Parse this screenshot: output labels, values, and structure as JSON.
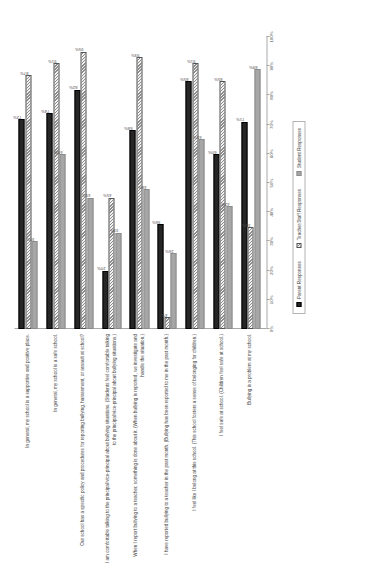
{
  "chart_data": {
    "type": "bar",
    "orientation": "vertical",
    "title": "",
    "xlabel": "",
    "ylabel": "",
    "ylim": [
      0,
      100
    ],
    "grid": false,
    "legend_position": "bottom",
    "tick_labels": [
      "0%",
      "10%",
      "20%",
      "30%",
      "40%",
      "50%",
      "60%",
      "70%",
      "80%",
      "90%",
      "100%"
    ],
    "tick_values": [
      0,
      10,
      20,
      30,
      40,
      50,
      60,
      70,
      80,
      90,
      100
    ],
    "categories": [
      "In general, my school is a supportive and positive place.",
      "In general, my school is a safe school.",
      "Our school has a specific policy and procedures for reporting bullying, harassment, or assault at school?",
      "I am comfortable talking to the principal/vice-principal about bullying situations. (Students feel comfortable talking to the principal/vice-principal about bullying situations.)",
      "When I report bullying to a teacher, something is done about it. (When bullying is reported, we investigate and handle the situation.)",
      "I have reported bullying to a teacher in the past month. (Bullying has been reported to me in the past month.)",
      "I feel like I belong at this school. (This school fosters a sense of belonging for children.)",
      "I feel safe at school. (Children feel safe at school.)",
      "Bullying is a problem at my school."
    ],
    "series": [
      {
        "name": "Student Responses",
        "color": "#262626",
        "values": [
          72,
          74,
          82,
          20,
          68,
          36,
          85,
          60,
          71
        ],
        "labels": [
          "72%",
          "74%",
          "82%",
          "20%",
          "68%",
          "36%",
          "85%",
          "60%",
          "71%"
        ]
      },
      {
        "name": "Teacher/Staff Responses",
        "color": "#f2f2f2",
        "values": [
          87,
          91,
          95,
          45,
          93,
          4,
          91,
          85,
          35
        ],
        "labels": [
          "87%",
          "91%",
          "95%",
          "45%",
          "93%",
          "4%",
          "91%",
          "85%",
          "35%"
        ]
      },
      {
        "name": "Student Responses ",
        "color": "#a6a6a6",
        "values": [
          30,
          60,
          45,
          33,
          48,
          26,
          65,
          42,
          89
        ],
        "labels": [
          "30%",
          "60%",
          "45%",
          "33%",
          "48%",
          "26%",
          "65%",
          "42%",
          "89%"
        ]
      }
    ]
  },
  "legend": {
    "items": [
      {
        "label": "Parent Responses",
        "swatch": "s0"
      },
      {
        "label": "Teacher/Staff Responses",
        "swatch": "s1"
      },
      {
        "label": "Student Responses",
        "swatch": "s2"
      }
    ]
  }
}
